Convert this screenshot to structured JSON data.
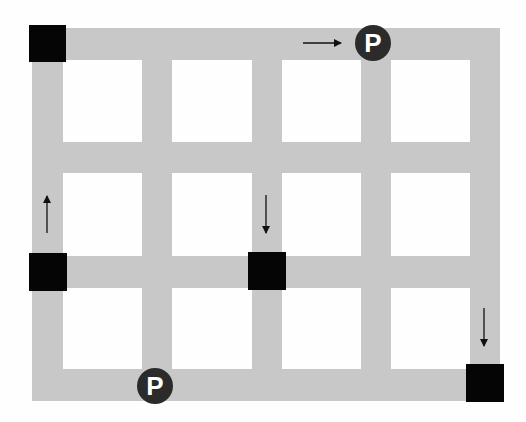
{
  "diagram": {
    "title": "",
    "colors": {
      "background": "#fefefe",
      "road": "#c8c8c8",
      "block": "#050505",
      "parking_bg": "#2b2b2b",
      "parking_text": "#ffffff",
      "arrow": "#111111"
    },
    "roads": {
      "vertical": [
        {
          "x": 32,
          "width": 31
        },
        {
          "x": 142,
          "width": 30
        },
        {
          "x": 252,
          "width": 30
        },
        {
          "x": 361,
          "width": 30
        },
        {
          "x": 470,
          "width": 30
        }
      ],
      "horizontal": [
        {
          "y": 28,
          "height": 32
        },
        {
          "y": 142,
          "height": 31
        },
        {
          "y": 256,
          "height": 32
        },
        {
          "y": 369,
          "height": 32
        }
      ],
      "extent": {
        "left": 32,
        "top": 28,
        "right": 500,
        "bottom": 401
      }
    },
    "blocks": [
      {
        "id": "block-top-left",
        "x": 29,
        "y": 25,
        "size": 37
      },
      {
        "id": "block-mid-left",
        "x": 29,
        "y": 253,
        "size": 38
      },
      {
        "id": "block-center",
        "x": 248,
        "y": 252,
        "size": 38
      },
      {
        "id": "block-bottom-right",
        "x": 466,
        "y": 364,
        "size": 38
      }
    ],
    "parking": [
      {
        "id": "parking-top",
        "label": "P",
        "cx": 373,
        "cy": 43,
        "r": 18
      },
      {
        "id": "parking-bottom",
        "label": "P",
        "cx": 155,
        "cy": 386,
        "r": 18
      }
    ],
    "arrows": [
      {
        "id": "arrow-right-top",
        "direction": "right",
        "x1": 303,
        "y1": 43,
        "x2": 341,
        "y2": 43
      },
      {
        "id": "arrow-up-left",
        "direction": "up",
        "x1": 47,
        "y1": 233,
        "x2": 47,
        "y2": 196
      },
      {
        "id": "arrow-down-center",
        "direction": "down",
        "x1": 266,
        "y1": 195,
        "x2": 266,
        "y2": 233
      },
      {
        "id": "arrow-down-right",
        "direction": "down",
        "x1": 484,
        "y1": 308,
        "x2": 484,
        "y2": 346
      }
    ]
  }
}
